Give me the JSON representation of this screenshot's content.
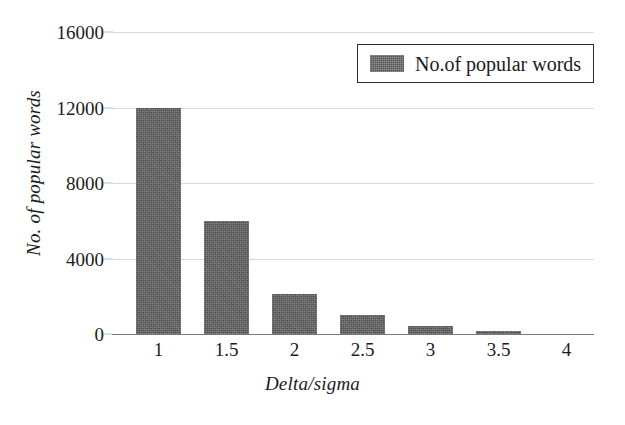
{
  "chart_data": {
    "type": "bar",
    "title": "",
    "subtitle": "",
    "xlabel": "Delta/sigma",
    "ylabel": "No. of popular words",
    "categories": [
      "1",
      "1.5",
      "2",
      "2.5",
      "3",
      "3.5",
      "4"
    ],
    "values": [
      12000,
      6000,
      2100,
      1000,
      400,
      150,
      0
    ],
    "series": [
      {
        "name": "No.of popular words",
        "values": [
          12000,
          6000,
          2100,
          1000,
          400,
          150,
          0
        ]
      }
    ],
    "ylim": [
      0,
      16000
    ],
    "yticks": [
      0,
      4000,
      8000,
      12000,
      16000
    ],
    "ytick_labels": [
      "0",
      "4000",
      "8000",
      "12000",
      "16000"
    ],
    "xtick_labels": [
      "1",
      "1.5",
      "2",
      "2.5",
      "3",
      "3.5",
      "4"
    ],
    "grid": "horizontal",
    "legend": {
      "position": "top-right",
      "entries": [
        "No.of popular words"
      ]
    },
    "colors": {
      "bar": "#606060",
      "gridline": "#d9d9d9",
      "axis": "#7a7a7a",
      "text": "#1b1b1b",
      "background": "#ffffff",
      "legend_border": "#2b2b2b"
    }
  }
}
